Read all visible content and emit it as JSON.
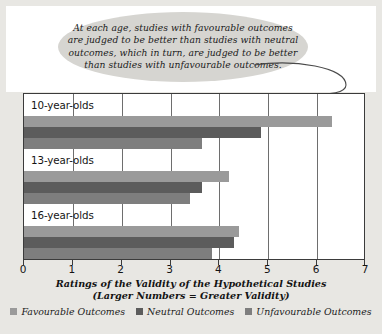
{
  "callout": {
    "lines": [
      "At each age, studies with favourable outcomes",
      "are judged to be better than studies with neutral",
      "outcomes, which in turn, are judged to be better",
      "than studies with unfavourable outcomes."
    ]
  },
  "axis": {
    "ticks": [
      "0",
      "1",
      "2",
      "3",
      "4",
      "5",
      "6",
      "7"
    ]
  },
  "xtitle": {
    "line1": "Ratings of the Validity of  the Hypothetical Studies",
    "line2": "(Larger Numbers = Greater Validity)"
  },
  "colors": {
    "favourable": "#9a9a9a",
    "neutral": "#5c5c5c",
    "unfavourable": "#7e7e7e",
    "frame": "#3b3b3b",
    "grid": "#6e6e6e",
    "panel": "#ffffff",
    "page_background": "#e8e7e3",
    "callout_fill": "#d6d5d1"
  },
  "chart_data": {
    "type": "bar",
    "orientation": "horizontal",
    "title": "",
    "xlabel": "Ratings of the Validity of  the Hypothetical Studies (Larger Numbers = Greater Validity)",
    "ylabel": "",
    "xlim": [
      0,
      7
    ],
    "grid": true,
    "legend_position": "bottom",
    "categories": [
      "10-year-olds",
      "13-year-olds",
      "16-year-olds"
    ],
    "series": [
      {
        "name": "Favourable Outcomes",
        "color": "#9a9a9a",
        "values": [
          6.3,
          4.2,
          4.4
        ]
      },
      {
        "name": "Neutral Outcomes",
        "color": "#5c5c5c",
        "values": [
          4.85,
          3.65,
          4.3
        ]
      },
      {
        "name": "Unfavourable Outcomes",
        "color": "#7e7e7e",
        "values": [
          3.65,
          3.4,
          3.85
        ]
      }
    ],
    "annotations": [
      {
        "text": "At each age, studies with favourable outcomes are judged to be better than studies with neutral outcomes, which in turn, are judged to be better than studies with unfavourable outcomes.",
        "points_to": {
          "category": "10-year-olds",
          "series": "Favourable Outcomes"
        }
      }
    ]
  }
}
